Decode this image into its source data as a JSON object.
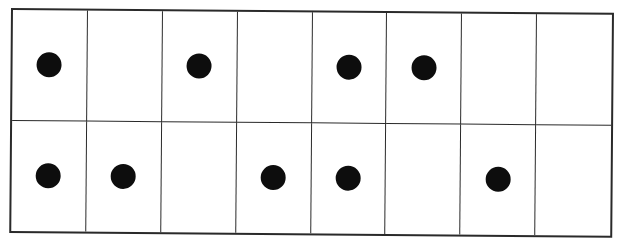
{
  "grid": {
    "description": "counting grid with dots",
    "columns": 8,
    "rows": 2,
    "cells": [
      [
        1,
        0,
        1,
        0,
        1,
        1,
        0,
        0
      ],
      [
        1,
        1,
        0,
        1,
        1,
        0,
        1,
        0
      ]
    ],
    "dot_count_row1": 4,
    "dot_count_row2": 5,
    "dot_count_total": 9,
    "dot_color": "#0d0d0d",
    "line_color": "#2a2a2a",
    "background_color": "#ffffff"
  }
}
